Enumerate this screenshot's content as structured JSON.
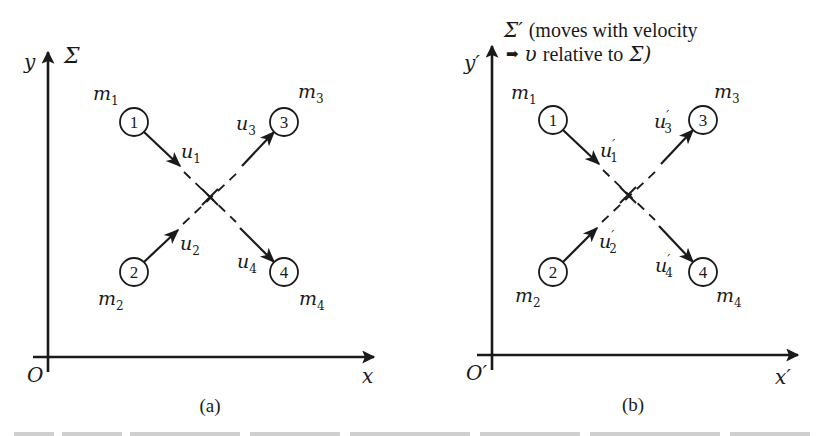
{
  "figure": {
    "panels": [
      {
        "id": "a",
        "caption": "(a)",
        "frame_label": "Σ",
        "frame_note_line1": "",
        "frame_note_line2": "",
        "y_axis_label": "y",
        "x_axis_label": "x",
        "origin_label": "O",
        "particles": [
          {
            "number": "1",
            "mass_base": "m",
            "mass_sub": "1",
            "vel_base": "u",
            "vel_prime": "",
            "vel_sub": "1"
          },
          {
            "number": "2",
            "mass_base": "m",
            "mass_sub": "2",
            "vel_base": "u",
            "vel_prime": "",
            "vel_sub": "2"
          },
          {
            "number": "3",
            "mass_base": "m",
            "mass_sub": "3",
            "vel_base": "u",
            "vel_prime": "",
            "vel_sub": "3"
          },
          {
            "number": "4",
            "mass_base": "m",
            "mass_sub": "4",
            "vel_base": "u",
            "vel_prime": "",
            "vel_sub": "4"
          }
        ]
      },
      {
        "id": "b",
        "caption": "(b)",
        "frame_label": "Σ′",
        "frame_note_line1": "(moves with velocity",
        "frame_note_arrow": "➡",
        "frame_note_line2_var": "υ",
        "frame_note_line2": "relative to",
        "frame_note_line2_end": "Σ)",
        "y_axis_label": "y′",
        "x_axis_label": "x′",
        "origin_label": "O′",
        "particles": [
          {
            "number": "1",
            "mass_base": "m",
            "mass_sub": "1",
            "vel_base": "u",
            "vel_prime": "′",
            "vel_sub": "1"
          },
          {
            "number": "2",
            "mass_base": "m",
            "mass_sub": "2",
            "vel_base": "u",
            "vel_prime": "′",
            "vel_sub": "2"
          },
          {
            "number": "3",
            "mass_base": "m",
            "mass_sub": "3",
            "vel_base": "u",
            "vel_prime": "′",
            "vel_sub": "3"
          },
          {
            "number": "4",
            "mass_base": "m",
            "mass_sub": "4",
            "vel_base": "u",
            "vel_prime": "′",
            "vel_sub": "4"
          }
        ]
      }
    ],
    "colors": {
      "ink": "#1a1a1a",
      "paper": "#ffffff"
    }
  }
}
